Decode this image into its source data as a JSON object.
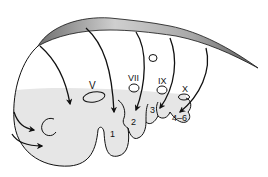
{
  "diagram": {
    "colors": {
      "background": "#ffffff",
      "shaded_region": "#e6e6e6",
      "neural_tube_gradient_light": "#dcdcdc",
      "neural_tube_gradient_dark": "#7a7a7a",
      "stroke": "#111111"
    },
    "placode_labels": {
      "v": "V",
      "vii": "VII",
      "ix": "IX",
      "x": "X"
    },
    "arch_labels": {
      "arch1": "1",
      "arch2": "2",
      "arch3": "3",
      "arch4_6": "4–6"
    }
  }
}
